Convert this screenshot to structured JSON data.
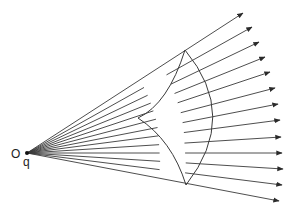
{
  "labels": {
    "origin": "O",
    "charge": "q"
  },
  "colors": {
    "line": "#3a3a3a",
    "background": "#ffffff"
  },
  "geometry": {
    "source": [
      27,
      153
    ],
    "top_corner": [
      185,
      50
    ],
    "bottom_corner": [
      186,
      185
    ],
    "inner_cusp": [
      138,
      118
    ],
    "arrow_tips": [
      [
        243,
        13
      ],
      [
        252,
        27
      ],
      [
        259,
        42
      ],
      [
        265,
        57
      ],
      [
        270,
        72
      ],
      [
        275,
        88
      ],
      [
        278,
        104
      ],
      [
        280,
        120
      ],
      [
        281,
        137
      ],
      [
        282,
        153
      ],
      [
        283,
        169
      ],
      [
        282,
        185
      ],
      [
        279,
        201
      ]
    ]
  }
}
